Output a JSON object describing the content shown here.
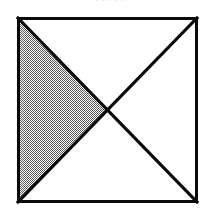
{
  "page": {
    "background_color": "#ffffff",
    "width": 219,
    "height": 216
  },
  "caption_remnant": {
    "text": ". . . . .",
    "note": "cut-off descenders of a caption line above the figure"
  },
  "figure": {
    "name": "square-with-both-diagonals-left-triangle-shaded",
    "shape": "square",
    "stroke_color": "#000000",
    "fill_color": "#ffffff",
    "shade_color": "#808080",
    "shade_pattern": "50-percent-checkerboard-dither",
    "border_width": 3,
    "diagonal_width": 3,
    "square": {
      "x": 17,
      "y": 17,
      "width": 181,
      "height": 186
    },
    "center": {
      "x": 107.5,
      "y": 110
    },
    "corners": {
      "top_left": {
        "x": 17,
        "y": 17
      },
      "top_right": {
        "x": 198,
        "y": 17
      },
      "bottom_right": {
        "x": 198,
        "y": 203
      },
      "bottom_left": {
        "x": 17,
        "y": 203
      }
    },
    "regions": [
      {
        "name": "top-triangle",
        "shaded": false
      },
      {
        "name": "right-triangle",
        "shaded": false
      },
      {
        "name": "bottom-triangle",
        "shaded": false
      },
      {
        "name": "left-triangle",
        "shaded": true
      }
    ],
    "diagonals": [
      {
        "name": "diagonal-top-left-to-bottom-right",
        "from": "top_left",
        "to": "bottom_right"
      },
      {
        "name": "diagonal-top-right-to-bottom-left",
        "from": "top_right",
        "to": "bottom_left"
      }
    ]
  }
}
